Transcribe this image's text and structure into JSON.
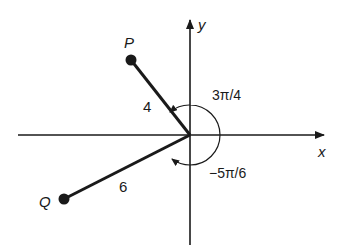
{
  "diagram": {
    "axes": {
      "x_label": "x",
      "y_label": "y"
    },
    "points": [
      {
        "name": "P",
        "label": "P",
        "length_label": "4",
        "angle_label": "3π/4"
      },
      {
        "name": "Q",
        "label": "Q",
        "length_label": "6",
        "angle_label": "−5π/6"
      }
    ],
    "colors": {
      "ink": "#1a1a1a",
      "background": "#ffffff"
    }
  }
}
